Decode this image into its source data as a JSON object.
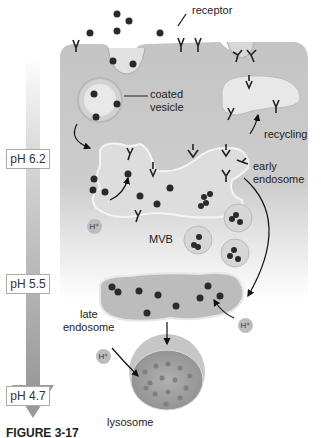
{
  "diagram": {
    "labels": {
      "receptor": "receptor",
      "coated_vesicle_line1": "coated",
      "coated_vesicle_line2": "vesicle",
      "recycling": "recycling",
      "early_endosome_line1": "early",
      "early_endosome_line2": "endosome",
      "mvb": "MVB",
      "late_endosome_line1": "late",
      "late_endosome_line2": "endosome",
      "lysosome": "lysosome",
      "h_plus": "H⁺"
    },
    "ph_scale": [
      {
        "label": "pH 6.2",
        "stage": "early endosome"
      },
      {
        "label": "pH 5.5",
        "stage": "late endosome"
      },
      {
        "label": "pH 4.7",
        "stage": "lysosome"
      }
    ],
    "caption": "FIGURE 3-17",
    "colors": {
      "cytoplasm": "#c8c8c8",
      "vesicle_fill": "#e4e4e4",
      "ligand": "#2a2a2a",
      "arrow_gradient_top": "#f0f0f0",
      "arrow_gradient_bottom": "#9a9a9a",
      "lysosome_fill": "#a8a8a8"
    }
  }
}
